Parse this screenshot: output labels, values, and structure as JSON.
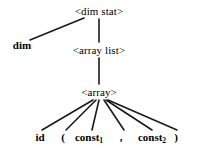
{
  "diagram": {
    "type": "parse-tree",
    "background_color": "#ffffff",
    "edge_color": "#1a1a1a",
    "text_color": "#000000",
    "nodes": [
      {
        "id": "dim_stat",
        "label": "<dim stat>",
        "kind": "nonterminal",
        "x": 99,
        "y": 11
      },
      {
        "id": "dim",
        "label": "dim",
        "kind": "terminal",
        "x": 22,
        "y": 45
      },
      {
        "id": "array_list",
        "label": "<array list>",
        "kind": "nonterminal",
        "x": 99,
        "y": 50
      },
      {
        "id": "array",
        "label": "<array>",
        "kind": "nonterminal",
        "x": 99,
        "y": 92
      },
      {
        "id": "id",
        "label": "id",
        "kind": "terminal",
        "x": 40,
        "y": 137
      },
      {
        "id": "lparen",
        "label": "(",
        "kind": "terminal",
        "x": 63,
        "y": 137
      },
      {
        "id": "const1",
        "label": "const",
        "sub": "1",
        "kind": "terminal",
        "x": 89,
        "y": 137
      },
      {
        "id": "comma",
        "label": ",",
        "kind": "terminal",
        "x": 121,
        "y": 137
      },
      {
        "id": "const2",
        "label": "const",
        "sub": "2",
        "kind": "terminal",
        "x": 152,
        "y": 137
      },
      {
        "id": "rparen",
        "label": ")",
        "kind": "terminal",
        "x": 176,
        "y": 137
      }
    ],
    "edges": [
      {
        "from": "dim_stat",
        "to": "dim",
        "x1": 84,
        "y1": 18,
        "x2": 30,
        "y2": 40
      },
      {
        "from": "dim_stat",
        "to": "array_list",
        "x1": 99,
        "y1": 19,
        "x2": 99,
        "y2": 42
      },
      {
        "from": "array_list",
        "to": "array",
        "x1": 99,
        "y1": 58,
        "x2": 99,
        "y2": 84
      },
      {
        "from": "array",
        "to": "id",
        "x1": 93,
        "y1": 100,
        "x2": 42,
        "y2": 130
      },
      {
        "from": "array",
        "to": "lparen",
        "x1": 96,
        "y1": 100,
        "x2": 66,
        "y2": 130
      },
      {
        "from": "array",
        "to": "const1",
        "x1": 99,
        "y1": 100,
        "x2": 92,
        "y2": 130
      },
      {
        "from": "array",
        "to": "comma",
        "x1": 104,
        "y1": 100,
        "x2": 124,
        "y2": 130
      },
      {
        "from": "array",
        "to": "const2",
        "x1": 106,
        "y1": 100,
        "x2": 152,
        "y2": 130
      },
      {
        "from": "array",
        "to": "rparen",
        "x1": 108,
        "y1": 100,
        "x2": 177,
        "y2": 130
      }
    ]
  }
}
